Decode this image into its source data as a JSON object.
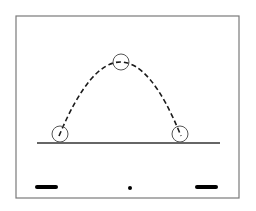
{
  "diagram": {
    "colors": {
      "frame": "#7a7a7a",
      "ground": "#333333",
      "trajectory": "#1a1a1a",
      "circle": "#555555",
      "marker": "#000000",
      "background": "#ffffff"
    },
    "frame": {
      "x": 16,
      "y": 16,
      "width": 223,
      "height": 182
    },
    "ground_line": {
      "x1": 37,
      "y1": 143,
      "x2": 220,
      "y2": 143
    },
    "trajectory": {
      "style": "dashed",
      "start": {
        "x": 59,
        "y": 136
      },
      "apex": {
        "x": 121,
        "y": 62
      },
      "end": {
        "x": 181,
        "y": 136
      }
    },
    "circles": [
      {
        "name": "launch-position",
        "cx": 60,
        "cy": 134,
        "r": 8
      },
      {
        "name": "apex-position",
        "cx": 121,
        "cy": 62,
        "r": 8
      },
      {
        "name": "landing-position",
        "cx": 180,
        "cy": 134,
        "r": 8
      }
    ],
    "markers": [
      {
        "name": "left-bar",
        "type": "bar",
        "x1": 37,
        "x2": 56,
        "y": 187
      },
      {
        "name": "center-dot",
        "type": "dot",
        "cx": 130,
        "cy": 188,
        "r": 2
      },
      {
        "name": "right-bar",
        "type": "bar",
        "x1": 197,
        "x2": 216,
        "y": 187
      }
    ]
  }
}
